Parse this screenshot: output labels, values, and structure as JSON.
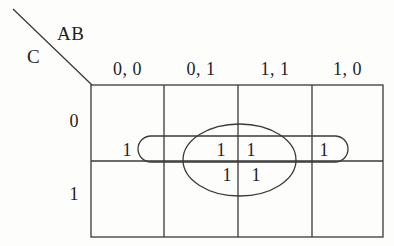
{
  "figure": {
    "type": "karnaugh-map",
    "title": "",
    "variables": {
      "columns": "AB",
      "rows": "C"
    },
    "colors": {
      "line": "#3a3a3a",
      "group": "#3a3a3a",
      "text": "#1f1f1f",
      "background": "#fdfdfc"
    }
  },
  "axes": {
    "column_variable_label": "AB",
    "row_variable_label": "C"
  },
  "columns": [
    {
      "label": "0, 0"
    },
    {
      "label": "0, 1"
    },
    {
      "label": "1, 1"
    },
    {
      "label": "1, 0"
    }
  ],
  "rows": [
    {
      "label": "0"
    },
    {
      "label": "1"
    }
  ],
  "cells": {
    "r0c0": "1",
    "r0c1": "1",
    "r0c2": "1",
    "r0c3": "1",
    "r1c0": "",
    "r1c1": "1",
    "r1c2": "1",
    "r1c3": ""
  },
  "groups": [
    {
      "name": "row-0-wrap-group",
      "shape": "rounded-rectangle",
      "covers": "C=0 across AB = 0,0 / 0,1 / 1,1 / 1,0"
    },
    {
      "name": "middle-columns-group",
      "shape": "ellipse",
      "covers": "AB = 0,1 and 1,1 for C = 0 and C = 1"
    }
  ]
}
